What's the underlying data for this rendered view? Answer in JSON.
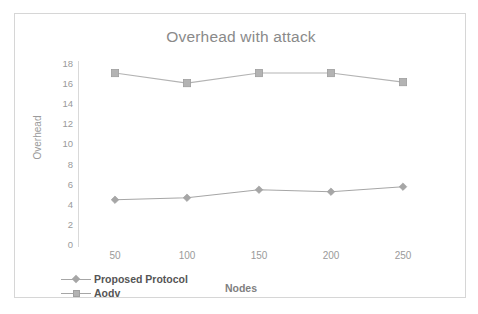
{
  "chart_data": {
    "type": "line",
    "title": "Overhead with attack",
    "xlabel": "Nodes",
    "ylabel": "Overhead",
    "categories": [
      "50",
      "100",
      "150",
      "200",
      "250"
    ],
    "x": [
      50,
      100,
      150,
      200,
      250
    ],
    "xtick_labels": [
      "50",
      "100",
      "150",
      "200",
      "250"
    ],
    "ytick_labels": [
      "18",
      "16",
      "14",
      "12",
      "10",
      "8",
      "6",
      "4",
      "2",
      "0"
    ],
    "yticks": [
      18,
      16,
      14,
      12,
      10,
      8,
      6,
      4,
      2,
      0
    ],
    "ylim": [
      0,
      18
    ],
    "grid": false,
    "legend_position": "bottom-left",
    "series": [
      {
        "name": "Proposed Protocol",
        "marker": "diamond",
        "color": "#a6a6a6",
        "values": [
          4.4,
          4.6,
          5.4,
          5.2,
          5.7
        ]
      },
      {
        "name": "Aodv",
        "marker": "square",
        "color": "#b3b3b3",
        "values": [
          17.0,
          16.0,
          17.0,
          17.0,
          16.1
        ]
      }
    ]
  },
  "legend": {
    "items": [
      {
        "label": "Proposed Protocol",
        "marker": "diamond"
      },
      {
        "label": "Aodv",
        "marker": "square"
      }
    ]
  },
  "colors": {
    "border": "#d6d6d6",
    "title_text": "#8a8a8a",
    "tick_text": "#9a9a9a",
    "axis_line": "#d9d9d9",
    "series_proposed": "#a6a6a6",
    "series_aodv": "#b3b3b3",
    "background": "#ffffff"
  }
}
